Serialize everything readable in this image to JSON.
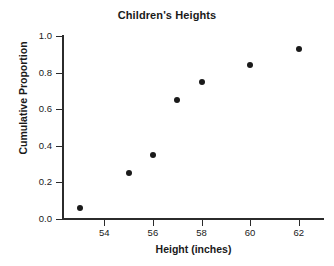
{
  "chart_data": {
    "type": "scatter",
    "title": "Children's Heights",
    "xlabel": "Height (inches)",
    "ylabel": "Cumulative Proportion",
    "x": [
      53,
      55,
      56,
      57,
      58,
      60,
      62
    ],
    "values": [
      0.06,
      0.25,
      0.35,
      0.65,
      0.75,
      0.84,
      0.93
    ],
    "points": [
      {
        "x": 53,
        "y": 0.06
      },
      {
        "x": 55,
        "y": 0.25
      },
      {
        "x": 56,
        "y": 0.35
      },
      {
        "x": 57,
        "y": 0.65
      },
      {
        "x": 58,
        "y": 0.75
      },
      {
        "x": 60,
        "y": 0.84
      },
      {
        "x": 62,
        "y": 0.93
      }
    ],
    "xlim": [
      52.3,
      63.0
    ],
    "ylim": [
      0.0,
      1.0
    ],
    "xticks": [
      54,
      56,
      58,
      60,
      62
    ],
    "xtick_labels": [
      "54",
      "56",
      "58",
      "60",
      "62"
    ],
    "yticks": [
      0.0,
      0.2,
      0.4,
      0.6,
      0.8,
      1.0
    ],
    "ytick_labels": [
      "0.0",
      "0.2",
      "0.4",
      "0.6",
      "0.8",
      "1.0"
    ],
    "grid": false,
    "legend": false,
    "marker": "filled-circle",
    "marker_color": "#1a1a1a",
    "axis_color": "#2b2b2b",
    "background_color": "#ffffff"
  }
}
